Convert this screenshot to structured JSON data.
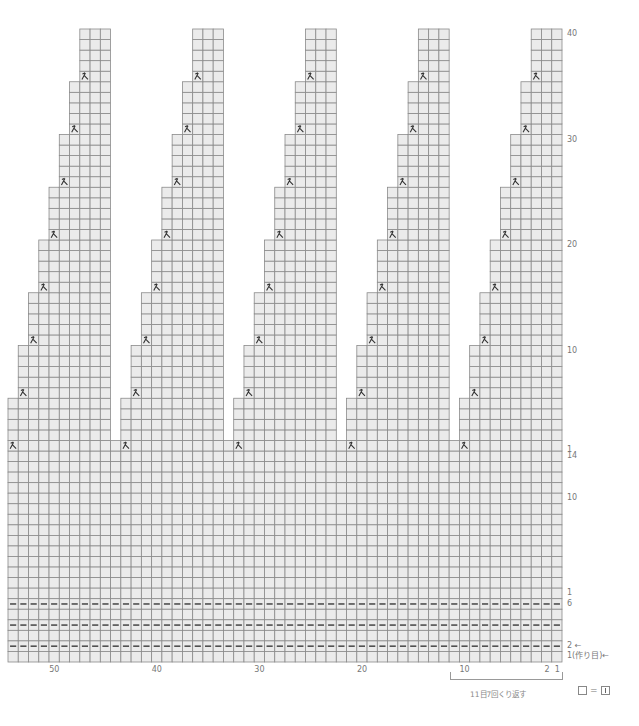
{
  "diagram": {
    "type": "knitting-chart",
    "columns": 54,
    "repeat_width": 11,
    "repeats": 5,
    "upper_rows": 40,
    "lower_rows": 20,
    "decrease_symbol": "k2tog-left-icon",
    "purl_rows_from_bottom": [
      2,
      4,
      6
    ],
    "colors": {
      "cell_fill": "#ebebeb",
      "grid_line": "#8a8a8a",
      "symbol": "#333333",
      "text": "#777777"
    }
  },
  "labels": {
    "right_upper": [
      {
        "text": "40",
        "row_from_top": 1
      },
      {
        "text": "30",
        "row_from_top": 11
      },
      {
        "text": "20",
        "row_from_top": 21
      },
      {
        "text": "10",
        "row_from_top": 31
      },
      {
        "text": "1",
        "row_from_top": 40
      }
    ],
    "right_lower": [
      {
        "text": "14",
        "row_from_top": 41
      },
      {
        "text": "10",
        "row_from_top": 45
      },
      {
        "text": "1",
        "row_from_top": 54
      },
      {
        "text": "6",
        "row_from_top": 55
      },
      {
        "text": "2 ←",
        "row_from_top": 59
      },
      {
        "text": "1(作り目)←",
        "row_from_top": 60
      }
    ],
    "bottom_columns": [
      {
        "text": "50",
        "col": 50
      },
      {
        "text": "40",
        "col": 40
      },
      {
        "text": "30",
        "col": 30
      },
      {
        "text": "20",
        "col": 20
      },
      {
        "text": "10",
        "col": 10
      },
      {
        "text": "2",
        "col": 2
      },
      {
        "text": "1",
        "col": 1
      }
    ],
    "repeat_note": "11目7回くり返す",
    "legend_equals": "="
  }
}
